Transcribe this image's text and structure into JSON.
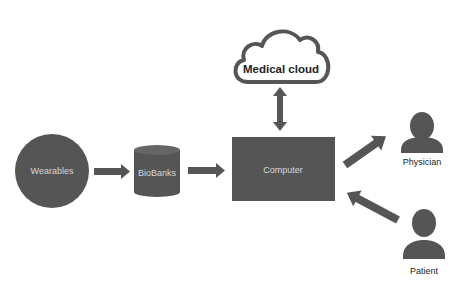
{
  "diagram": {
    "nodes": {
      "wearables": {
        "label": "Wearables",
        "shape": "circle"
      },
      "biobanks": {
        "label": "BioBanks",
        "shape": "cylinder"
      },
      "computer": {
        "label": "Computer",
        "shape": "rectangle"
      },
      "cloud": {
        "label": "Medical cloud",
        "shape": "cloud"
      },
      "physician": {
        "label": "Physician",
        "shape": "person"
      },
      "patient": {
        "label": "Patient",
        "shape": "person"
      }
    },
    "edges": [
      {
        "from": "Wearables",
        "to": "BioBanks"
      },
      {
        "from": "BioBanks",
        "to": "Computer"
      },
      {
        "from": "Computer",
        "to": "Medical cloud",
        "bidirectional": true
      },
      {
        "from": "Computer",
        "to": "Physician"
      },
      {
        "from": "Patient",
        "to": "Computer"
      }
    ],
    "colors": {
      "fill": "#555555",
      "text_light": "#d8d8d8",
      "text_dark": "#222222"
    }
  }
}
